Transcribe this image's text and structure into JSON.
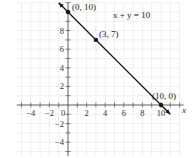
{
  "chart_data": {
    "type": "line",
    "title": "",
    "equation": "x + y = 10",
    "xlabel": "x",
    "ylabel": "y",
    "xlim": [
      -5.5,
      12
    ],
    "ylim": [
      -5.5,
      11
    ],
    "grid": true,
    "x_ticks": [
      -4,
      -2,
      0,
      2,
      4,
      6,
      8,
      10
    ],
    "y_ticks": [
      -4,
      -2,
      2,
      4,
      6,
      8
    ],
    "x_tick_labels": [
      "−4",
      "−2",
      "0",
      "2",
      "4",
      "6",
      "8",
      "10"
    ],
    "y_tick_labels": [
      "−4",
      "−2",
      "2",
      "4",
      "6",
      "8"
    ],
    "series": [
      {
        "name": "x + y = 10",
        "x": [
          -1,
          0,
          3,
          10,
          11
        ],
        "y": [
          11,
          10,
          7,
          0,
          -1
        ]
      }
    ],
    "points": [
      {
        "x": 0,
        "y": 10,
        "label": "(0, 10)"
      },
      {
        "x": 3,
        "y": 7,
        "label": "(3, 7)"
      },
      {
        "x": 10,
        "y": 0,
        "label": "(10, 0)"
      }
    ],
    "colors": {
      "line": "#1a1a1a",
      "axis": "#555555",
      "grid": "#e4e4e4"
    }
  }
}
